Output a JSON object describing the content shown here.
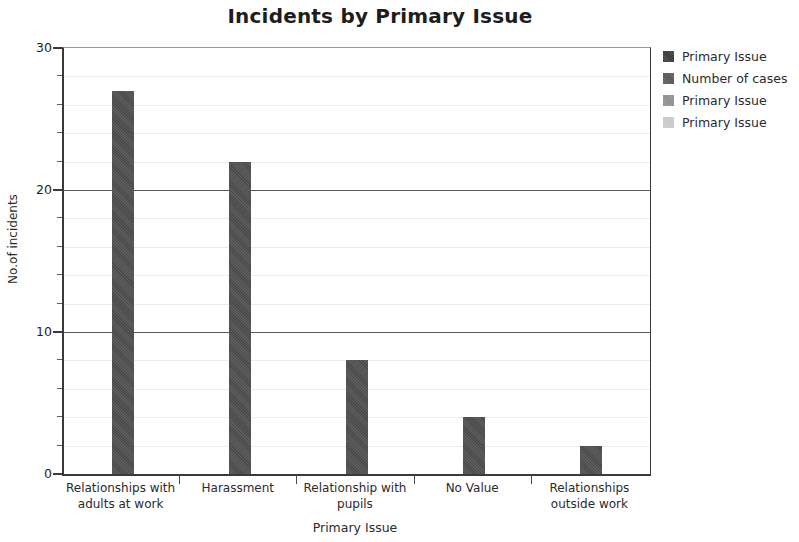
{
  "chart_data": {
    "type": "bar",
    "title": "Incidents by Primary Issue",
    "xlabel": "Primary Issue",
    "ylabel": "No.of incidents",
    "categories": [
      "Relationships with adults at work",
      "Harassment",
      "Relationship with pupils",
      "No Value",
      "Relationships outside work"
    ],
    "category_lines": [
      [
        "Relationships with",
        "adults at work"
      ],
      [
        "Harassment"
      ],
      [
        "Relationship with",
        "pupils"
      ],
      [
        "No Value"
      ],
      [
        "Relationships",
        "outside work"
      ]
    ],
    "series": [
      {
        "name": "Number of cases",
        "values": [
          27,
          22,
          8,
          4,
          2
        ],
        "color": "#4a4a4a"
      }
    ],
    "values": [
      27,
      22,
      8,
      4,
      2
    ],
    "ylim": [
      0,
      30
    ],
    "y_major_ticks": [
      0,
      10,
      20,
      30
    ],
    "y_tick_labels": [
      "0",
      "10",
      "20",
      "30"
    ],
    "y_minor_tick_step": 2,
    "grid": true,
    "grid_minor": true,
    "legend_position": "right",
    "bar_color": "#4a4a4a"
  },
  "legend": {
    "items": [
      {
        "label": "Primary Issue",
        "color": "#3a3a3a"
      },
      {
        "label": "Number of cases",
        "color": "#575757"
      },
      {
        "label": "Primary Issue",
        "color": "#8f8f8f"
      },
      {
        "label": "Primary Issue",
        "color": "#c9c9c9"
      }
    ]
  }
}
